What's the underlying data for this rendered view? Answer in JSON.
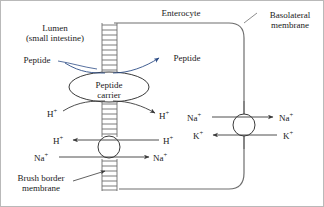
{
  "diagram": {
    "title_labels": {
      "lumen_line1": "Lumen",
      "lumen_line2": "(small intestine)",
      "enterocyte": "Enterocyte",
      "basolateral_line1": "Basolateral",
      "basolateral_line2": "membrane",
      "brush_line1": "Brush border",
      "brush_line2": "membrane"
    },
    "carrier": {
      "line1": "Peptide",
      "line2": "carrier"
    },
    "peptide_left": "Peptide",
    "peptide_right": "Peptide",
    "ions": {
      "h_apical_left": "H",
      "h_apical_right": "H",
      "h_exch_left": "H",
      "h_exch_right": "H",
      "na_exch_left": "Na",
      "na_exch_right": "Na",
      "na_baso_left": "Na",
      "na_baso_right": "Na",
      "k_baso_left": "K",
      "k_baso_right": "K",
      "charge_plus": "+"
    },
    "colors": {
      "peptide_blue": "#2d4d86",
      "line_black": "#3a3a3a",
      "membrane_gray": "#6e6e6e",
      "frame": "#b9b9b9"
    }
  }
}
